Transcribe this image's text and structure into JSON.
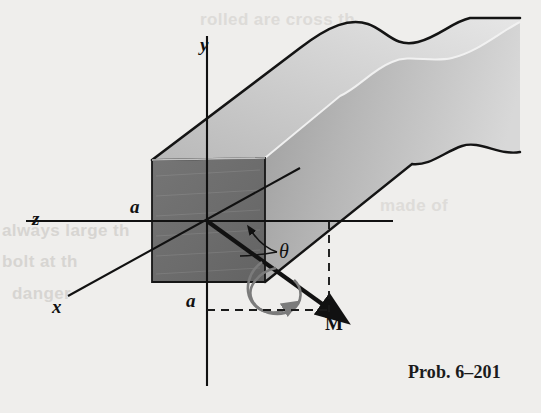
{
  "figure": {
    "title_caption": "Prob. 6–201",
    "axes": [
      {
        "name": "y-axis",
        "label": "y"
      },
      {
        "name": "z-axis",
        "label": "z"
      },
      {
        "name": "x-axis",
        "label": "x"
      }
    ],
    "dimensions": [
      {
        "name": "width-dimension-a",
        "label": "a"
      },
      {
        "name": "height-dimension-a",
        "label": "a"
      }
    ],
    "angle": {
      "name": "theta-angle",
      "label": "θ"
    },
    "vector": {
      "name": "moment-vector-M",
      "label": "M"
    },
    "colors": {
      "background": "#efeeec",
      "front_face_dark": "#6e6e6e",
      "top_face_light": "#c9c9c9",
      "side_face_mid": "#b4b4b4",
      "line_dark": "#111111",
      "dashed_line": "#1a1a1a",
      "torque_arrow": "#777777"
    }
  },
  "page_bleed_text": [
    {
      "text": "always large th"
    },
    {
      "text": "bolt at th"
    },
    {
      "text": "danger"
    },
    {
      "text": "rolled are cross th"
    },
    {
      "text": "made of"
    }
  ]
}
